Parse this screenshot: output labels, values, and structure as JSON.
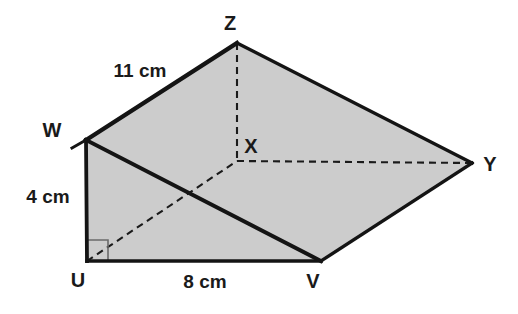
{
  "figure": {
    "shape_name": "triangular-prism",
    "fill_color": "#cccccc",
    "stroke_color": "#141414",
    "background_color": "#ffffff",
    "vertices": [
      {
        "name": "Z",
        "label": "Z",
        "x": 237,
        "y": 43,
        "label_x": 230,
        "label_y": 30
      },
      {
        "name": "W",
        "label": "W",
        "x": 86,
        "y": 140,
        "label_x": 52,
        "label_y": 137
      },
      {
        "name": "X",
        "label": "X",
        "x": 237,
        "y": 161,
        "label_x": 244,
        "label_y": 153
      },
      {
        "name": "Y",
        "label": "Y",
        "x": 472,
        "y": 163,
        "label_x": 483,
        "label_y": 171
      },
      {
        "name": "U",
        "label": "U",
        "x": 87,
        "y": 261,
        "label_x": 78,
        "label_y": 287
      },
      {
        "name": "V",
        "label": "V",
        "x": 321,
        "y": 261,
        "label_x": 313,
        "label_y": 288
      }
    ],
    "dimensions": [
      {
        "name": "edge-wz-length",
        "value": "11 cm",
        "x": 140,
        "y": 77,
        "edge": "W-Z"
      },
      {
        "name": "edge-wu-length",
        "value": "4 cm",
        "x": 48,
        "y": 203,
        "edge": "W-U"
      },
      {
        "name": "edge-uv-length",
        "value": "8 cm",
        "x": 205,
        "y": 288,
        "edge": "U-V"
      }
    ],
    "solid_edges": [
      {
        "name": "edge-w-z",
        "from": "W",
        "to": "Z"
      },
      {
        "name": "edge-z-y",
        "from": "Z",
        "to": "Y"
      },
      {
        "name": "edge-y-v",
        "from": "Y",
        "to": "V"
      },
      {
        "name": "edge-v-u",
        "from": "V",
        "to": "U"
      },
      {
        "name": "edge-u-w",
        "from": "U",
        "to": "W"
      },
      {
        "name": "edge-w-v",
        "from": "W",
        "to": "V"
      }
    ],
    "dashed_edges": [
      {
        "name": "hidden-edge-z-x",
        "from": "Z",
        "to": "X"
      },
      {
        "name": "hidden-edge-x-y",
        "from": "X",
        "to": "Y"
      },
      {
        "name": "hidden-edge-u-x",
        "from": "U",
        "to": "X"
      }
    ],
    "right_angle": {
      "name": "right-angle-marker-at-u",
      "at_vertex": "U",
      "size": 21
    }
  }
}
